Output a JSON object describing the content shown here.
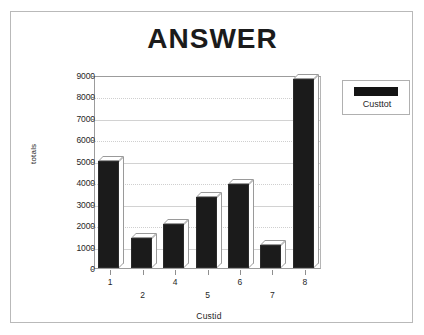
{
  "chart_data": {
    "type": "bar",
    "title": "ANSWER",
    "xlabel": "Custid",
    "ylabel": "totals",
    "categories": [
      "1",
      "2",
      "4",
      "5",
      "6",
      "7",
      "8"
    ],
    "values": [
      5000,
      1380,
      2050,
      3300,
      3900,
      1080,
      8800
    ],
    "series": [
      {
        "name": "Custtot",
        "values": [
          5000,
          1380,
          2050,
          3300,
          3900,
          1080,
          8800
        ],
        "color": "#1b1b1b"
      }
    ],
    "ylim": [
      0,
      9000
    ],
    "ytick_labels": [
      "0",
      "1000",
      "2000",
      "3000",
      "4000",
      "5000",
      "6000",
      "7000",
      "8000",
      "9000"
    ],
    "ytick_values": [
      0,
      1000,
      2000,
      3000,
      4000,
      5000,
      6000,
      7000,
      8000,
      9000
    ],
    "grid": true,
    "grid_axis": "y",
    "legend_position": "right",
    "legend_entries": [
      "Custtot"
    ],
    "bar_style": "3d",
    "xlabel_stagger": true
  },
  "legend": {
    "label": "Custtot",
    "swatch_color": "#141414"
  },
  "frame": {
    "border_color": "#b9b9b9",
    "background": "#ffffff"
  }
}
